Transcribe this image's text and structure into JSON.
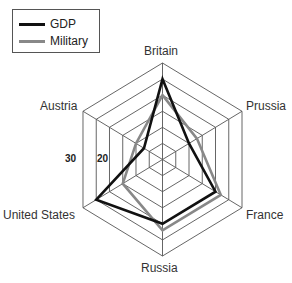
{
  "chart_data": {
    "type": "radar",
    "title": "",
    "axes": [
      "Britain",
      "Prussia",
      "France",
      "Russia",
      "United States",
      "Austria"
    ],
    "series": [
      {
        "name": "GDP",
        "color": "#111111",
        "values": [
          25,
          10,
          20,
          20,
          25,
          7
        ]
      },
      {
        "name": "Military",
        "color": "#888888",
        "values": [
          20,
          13,
          22,
          22,
          15,
          10
        ]
      }
    ],
    "range": [
      0,
      30
    ],
    "rings": 6,
    "tick_labels": [
      "30",
      "20"
    ],
    "grid": true,
    "legend_position": "top-left"
  },
  "legend": {
    "items": [
      {
        "label": "GDP"
      },
      {
        "label": "Military"
      }
    ]
  },
  "axis_labels": {
    "britain": "Britain",
    "prussia": "Prussia",
    "france": "France",
    "russia": "Russia",
    "united_states": "United States",
    "austria": "Austria"
  },
  "ticks": {
    "t30": "30",
    "t20": "20"
  },
  "colors": {
    "grid": "#555555",
    "gdp": "#111111",
    "military": "#888888"
  }
}
